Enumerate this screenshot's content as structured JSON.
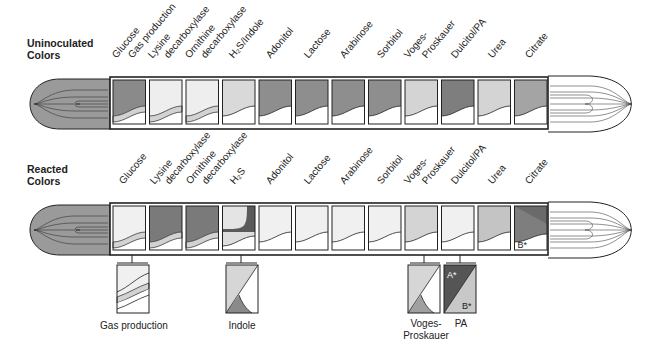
{
  "sections": {
    "uninoculated": {
      "label_line1": "Uninoculated",
      "label_line2": "Colors"
    },
    "reacted": {
      "label_line1": "Reacted",
      "label_line2": "Colors"
    }
  },
  "uninoculated_labels": [
    {
      "text": "Glucose",
      "x": 118,
      "y": 60
    },
    {
      "text": "Gas production",
      "x": 134,
      "y": 60
    },
    {
      "text": "Lysine",
      "x": 154,
      "y": 60
    },
    {
      "text": "decarboxylase",
      "x": 170,
      "y": 60
    },
    {
      "text": "Ornithine",
      "x": 191,
      "y": 60
    },
    {
      "text": "decarboxylase",
      "x": 207,
      "y": 60
    },
    {
      "text": "H₂S/Indole",
      "x": 235,
      "y": 60
    },
    {
      "text": "Adonitol",
      "x": 272,
      "y": 60
    },
    {
      "text": "Lactose",
      "x": 310,
      "y": 60
    },
    {
      "text": "Arabinose",
      "x": 346,
      "y": 60
    },
    {
      "text": "Sorbitol",
      "x": 383,
      "y": 60
    },
    {
      "text": "Voges-",
      "x": 410,
      "y": 60
    },
    {
      "text": "Proskauer",
      "x": 428,
      "y": 60
    },
    {
      "text": "Dulcitol/PA",
      "x": 457,
      "y": 60
    },
    {
      "text": "Urea",
      "x": 494,
      "y": 60
    },
    {
      "text": "Citrate",
      "x": 531,
      "y": 60
    }
  ],
  "reacted_labels": [
    {
      "text": "Glucose",
      "x": 125,
      "y": 186
    },
    {
      "text": "Lysine",
      "x": 156,
      "y": 186
    },
    {
      "text": "decarboxylase",
      "x": 171,
      "y": 186
    },
    {
      "text": "Ornithine",
      "x": 192,
      "y": 186
    },
    {
      "text": "decarboxylase",
      "x": 208,
      "y": 186
    },
    {
      "text": "H₂S",
      "x": 236,
      "y": 186
    },
    {
      "text": "Adonitol",
      "x": 272,
      "y": 186
    },
    {
      "text": "Lactose",
      "x": 310,
      "y": 186
    },
    {
      "text": "Arabinose",
      "x": 346,
      "y": 186
    },
    {
      "text": "Sorbitol",
      "x": 383,
      "y": 186
    },
    {
      "text": "Voges-",
      "x": 410,
      "y": 186
    },
    {
      "text": "Proskauer",
      "x": 428,
      "y": 186
    },
    {
      "text": "Dulcitol/PA",
      "x": 457,
      "y": 186
    },
    {
      "text": "Urea",
      "x": 494,
      "y": 186
    },
    {
      "text": "Citrate",
      "x": 531,
      "y": 186
    }
  ],
  "compartments": [
    "Glucose",
    "Lysine decarboxylase",
    "Ornithine decarboxylase",
    "H2S/Indole",
    "Adonitol",
    "Lactose",
    "Arabinose",
    "Sorbitol",
    "Voges-Proskauer",
    "Dulcitol/PA",
    "Urea",
    "Citrate"
  ],
  "colors": {
    "dark": "#7c7c7c",
    "darker": "#5e5e5e",
    "medium": "#a9a9a9",
    "light": "#d4d4d4",
    "pale": "#ececec",
    "white": "#ffffff",
    "stroke": "#222222"
  },
  "uninoculated_fills": [
    "#8a8a8a",
    "#eeeeee",
    "#eeeeee",
    "#d9d9d9",
    "#8e8e8e",
    "#8e8e8e",
    "#8e8e8e",
    "#8e8e8e",
    "#d4d4d4",
    "#7e7e7e",
    "#d4d4d4",
    "#a4a4a4"
  ],
  "reacted_fills": [
    "#f0f0f0",
    "#7a7a7a",
    "#7a7a7a",
    "#e0e0e0",
    "#f0f0f0",
    "#f0f0f0",
    "#f0f0f0",
    "#f0f0f0",
    "#d4d4d4",
    "#f0f0f0",
    "#c4c4c4",
    "#8a8a8a"
  ],
  "citrate_markers": {
    "b": "B",
    "a": "A",
    "star": "*"
  },
  "sub_tests": {
    "gas": {
      "label": "Gas production"
    },
    "indole": {
      "label": "Indole"
    },
    "vp": {
      "label_line1": "Voges-",
      "label_line2": "Proskauer"
    },
    "pa": {
      "label": "PA",
      "a_marker": "A",
      "b_marker": "B",
      "star": "*"
    }
  }
}
